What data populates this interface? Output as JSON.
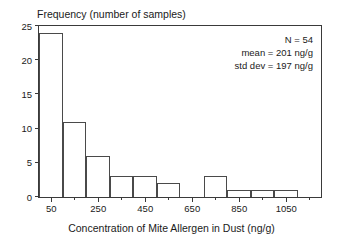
{
  "chart_data": {
    "type": "bar",
    "title": "",
    "xlabel": "Concentration of Mite Allergen in Dust (ng/g)",
    "ylabel": "Frequency (number of samples)",
    "bin_width": 100,
    "bin_starts": [
      0,
      100,
      200,
      300,
      400,
      500,
      600,
      700,
      800,
      900,
      1000,
      1100
    ],
    "categories": [
      "0-100",
      "100-200",
      "200-300",
      "300-400",
      "400-500",
      "500-600",
      "600-700",
      "700-800",
      "800-900",
      "900-1000",
      "1000-1100",
      "1100-1200"
    ],
    "values": [
      24,
      11,
      6,
      3,
      3,
      2,
      0,
      3,
      1,
      1,
      1,
      0
    ],
    "xlim": [
      0,
      1200
    ],
    "ylim": [
      0,
      25
    ],
    "xticks_major": [
      50,
      250,
      450,
      650,
      850,
      1050
    ],
    "xticks_minor": [
      150,
      350,
      550,
      750,
      950,
      1150
    ],
    "xtick_labels": [
      "50",
      "250",
      "450",
      "650",
      "850",
      "1050"
    ],
    "yticks": [
      0,
      5,
      10,
      15,
      20,
      25
    ],
    "ytick_labels": [
      "0",
      "5",
      "10",
      "15",
      "20",
      "25"
    ],
    "grid": false,
    "legend": "none",
    "annotations": [
      "N = 54",
      "mean = 201 ng/g",
      "std dev = 197 ng/g"
    ]
  },
  "stats": {
    "n": "N = 54",
    "mean": "mean = 201 ng/g",
    "std_dev": "std dev = 197 ng/g"
  }
}
